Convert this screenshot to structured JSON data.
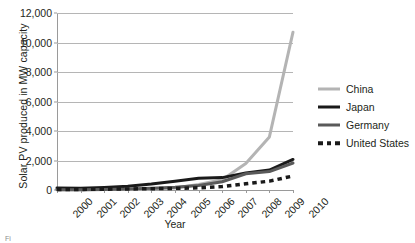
{
  "chart_data": {
    "type": "line",
    "title": "",
    "xlabel": "Year",
    "ylabel": "Solar PV produced in MW capacity",
    "x": [
      2000,
      2001,
      2002,
      2003,
      2004,
      2005,
      2006,
      2007,
      2008,
      2009,
      2010
    ],
    "categories": [
      "2000",
      "2001",
      "2002",
      "2003",
      "2004",
      "2005",
      "2006",
      "2007",
      "2008",
      "2009",
      "2010"
    ],
    "ylim": [
      0,
      12000
    ],
    "yticks": [
      0,
      2000,
      4000,
      6000,
      8000,
      10000,
      12000
    ],
    "ytick_labels": [
      "0",
      "2,000",
      "4,000",
      "6,000",
      "8,000",
      "10,000",
      "12,000"
    ],
    "grid": true,
    "legend_position": "right",
    "series": [
      {
        "name": "China",
        "color": "#b4b4b4",
        "style": "solid",
        "width": 3,
        "values": [
          19,
          23,
          30,
          40,
          60,
          130,
          370,
          700,
          1800,
          3600,
          10700
        ]
      },
      {
        "name": "Japan",
        "color": "#1a1a1a",
        "style": "solid",
        "width": 3,
        "values": [
          130,
          120,
          170,
          250,
          400,
          600,
          790,
          840,
          1150,
          1350,
          2070
        ]
      },
      {
        "name": "Germany",
        "color": "#5a5a5a",
        "style": "solid",
        "width": 3,
        "values": [
          20,
          25,
          35,
          60,
          120,
          190,
          310,
          560,
          1100,
          1250,
          1830
        ]
      },
      {
        "name": "United States",
        "color": "#1a1a1a",
        "style": "dotted",
        "width": 3.5,
        "values": [
          30,
          40,
          55,
          70,
          90,
          110,
          150,
          230,
          420,
          600,
          950
        ]
      }
    ]
  },
  "legend": {
    "items": [
      {
        "label": "China"
      },
      {
        "label": "Japan"
      },
      {
        "label": "Germany"
      },
      {
        "label": "United States"
      }
    ]
  },
  "artifact": {
    "text": "Fi"
  }
}
